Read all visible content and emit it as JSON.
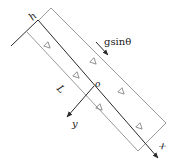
{
  "diagram": {
    "labels": {
      "h": "h",
      "force": "gsinθ",
      "origin": "o",
      "length": "L",
      "y_axis": "y",
      "x_axis": "x"
    },
    "markers": {
      "flow_direction_symbol": "▷",
      "count": 7
    },
    "colors": {
      "axis": "#2a2a2a",
      "boundary": "#9a9a9a",
      "marker": "#8a8a8a",
      "text": "#222222"
    }
  }
}
